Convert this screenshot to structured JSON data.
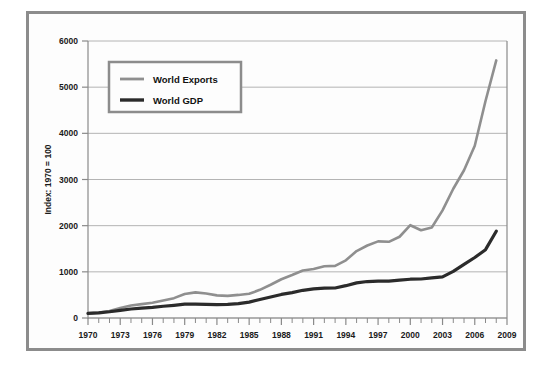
{
  "figure": {
    "frame_color": "#8c8c8c",
    "background_color": "#fdfdfd"
  },
  "chart_data": {
    "type": "line",
    "title": "",
    "subtitle": "",
    "xlabel": "",
    "ylabel": "Index: 1970 = 100",
    "xlim": [
      1970,
      2009
    ],
    "ylim": [
      0,
      6000
    ],
    "grid": true,
    "legend_position": "top-left",
    "x_tick_labels": [
      "1970",
      "1973",
      "1976",
      "1979",
      "1982",
      "1985",
      "1988",
      "1991",
      "1994",
      "1997",
      "2000",
      "2003",
      "2006",
      "2009"
    ],
    "x_tick_values": [
      1970,
      1973,
      1976,
      1979,
      1982,
      1985,
      1988,
      1991,
      1994,
      1997,
      2000,
      2003,
      2006,
      2009
    ],
    "x_minor_ticks": [
      1971,
      1972,
      1974,
      1975,
      1977,
      1978,
      1980,
      1981,
      1983,
      1984,
      1986,
      1987,
      1989,
      1990,
      1992,
      1993,
      1995,
      1996,
      1998,
      1999,
      2001,
      2002,
      2004,
      2005,
      2007,
      2008
    ],
    "y_tick_labels": [
      "0",
      "1000",
      "2000",
      "3000",
      "4000",
      "5000",
      "6000"
    ],
    "y_tick_values": [
      0,
      1000,
      2000,
      3000,
      4000,
      5000,
      6000
    ],
    "x": [
      1970,
      1971,
      1972,
      1973,
      1974,
      1975,
      1976,
      1977,
      1978,
      1979,
      1980,
      1981,
      1982,
      1983,
      1984,
      1985,
      1986,
      1987,
      1988,
      1989,
      1990,
      1991,
      1992,
      1993,
      1994,
      1995,
      1996,
      1997,
      1998,
      1999,
      2000,
      2001,
      2002,
      2003,
      2004,
      2005,
      2006,
      2007,
      2008
    ],
    "series": [
      {
        "name": "World Exports",
        "color": "#8f8f8f",
        "width": 2.6,
        "values": [
          100,
          120,
          150,
          215,
          270,
          300,
          330,
          380,
          430,
          520,
          555,
          530,
          490,
          480,
          500,
          525,
          610,
          720,
          840,
          930,
          1030,
          1060,
          1120,
          1130,
          1250,
          1450,
          1570,
          1660,
          1650,
          1760,
          2010,
          1900,
          1960,
          2330,
          2800,
          3200,
          3730,
          4700,
          5580
        ]
      },
      {
        "name": "World GDP",
        "color": "#2b2b2b",
        "width": 3.2,
        "values": [
          100,
          110,
          135,
          165,
          195,
          215,
          230,
          255,
          275,
          300,
          300,
          295,
          290,
          295,
          310,
          345,
          400,
          455,
          510,
          550,
          600,
          630,
          645,
          650,
          700,
          760,
          790,
          800,
          800,
          820,
          840,
          845,
          870,
          890,
          1010,
          1160,
          1310,
          1480,
          1880
        ]
      }
    ]
  },
  "legend": {
    "entries": [
      {
        "label": "World Exports",
        "color": "#8f8f8f"
      },
      {
        "label": "World GDP",
        "color": "#2b2b2b"
      }
    ]
  }
}
